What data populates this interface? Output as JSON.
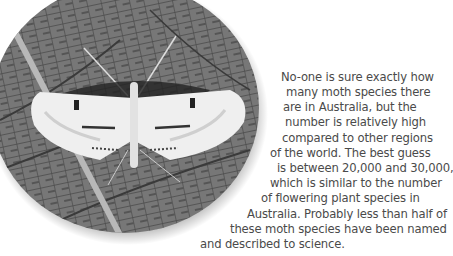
{
  "image": {
    "subject": "moth-on-leaf-photo",
    "shape": "circle",
    "tone": "grayscale"
  },
  "paragraph": {
    "lines": [
      "No-one is sure exactly how",
      "many moth species there",
      "are in Australia, but the",
      "number is relatively high",
      "compared to other regions",
      "of the world. The best guess",
      "is between 20,000 and 30,000,",
      "which is similar to the number",
      "of flowering plant species in",
      "Australia. Probably less than half of",
      "these moth species have been named",
      "and described to science."
    ]
  },
  "colors": {
    "text": "#4a4a4a",
    "background": "#ffffff",
    "leaf": "#6e6e6e"
  }
}
